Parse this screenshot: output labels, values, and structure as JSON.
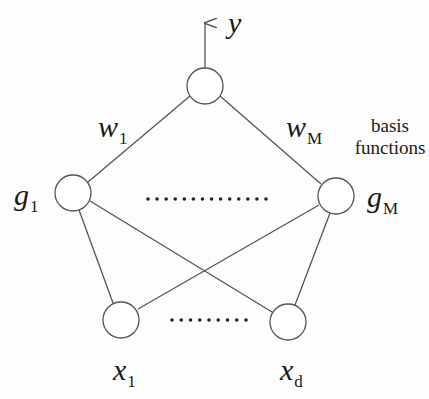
{
  "diagram": {
    "colors": {
      "stroke": "#555555",
      "text": "#1a1a1a",
      "background": "#fdfdfd"
    },
    "output": {
      "label": "y"
    },
    "weights": [
      {
        "symbol": "w",
        "subscript": "1"
      },
      {
        "symbol": "w",
        "subscript": "M"
      }
    ],
    "hidden": [
      {
        "symbol": "g",
        "subscript": "1"
      },
      {
        "symbol": "g",
        "subscript": "M"
      }
    ],
    "inputs": [
      {
        "symbol": "x",
        "subscript": "1"
      },
      {
        "symbol": "x",
        "subscript": "d"
      }
    ],
    "annotation": {
      "line1": "basis",
      "line2": "functions"
    },
    "ellipsis": {
      "hidden_dots": 14,
      "input_dots": 9
    }
  }
}
